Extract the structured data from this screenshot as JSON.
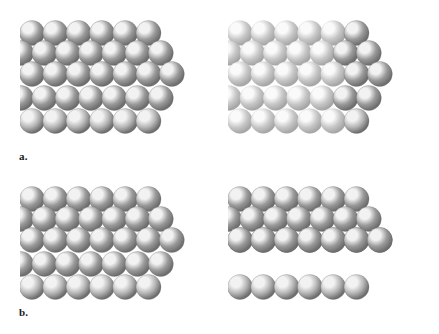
{
  "figure": {
    "background_color": "#ffffff",
    "width": 439,
    "height": 334,
    "labels": [
      {
        "id": "a",
        "text": "a.",
        "x": 19,
        "y": 151
      },
      {
        "id": "b",
        "text": "b.",
        "x": 19,
        "y": 307
      }
    ]
  },
  "sphere_style": {
    "base_color": "#9a9a9a",
    "highlight_color": "#f2f2f2",
    "midtone_color": "#b4b4b4",
    "shadow_color": "#6e6e6e",
    "edge_color": "#5a5a5a",
    "faded_base_color": "#c7c7c7",
    "faded_highlight_color": "#fafafa",
    "faded_shadow_color": "#a6a6a6",
    "radius": 12.5,
    "highlight_offset_x": -0.33,
    "highlight_offset_y": -0.38
  },
  "panels": [
    {
      "id": "a-left",
      "name": "hcp-aba-stacking-left-view",
      "row_label": "a",
      "column": "left",
      "x": 20,
      "y": 6,
      "width": 200,
      "height": 142,
      "faded_region": false,
      "columns": 6,
      "layers": [
        {
          "index": 0,
          "label": "top-row",
          "offset_x": 0,
          "y": 27,
          "count": 6,
          "shade": "mid"
        },
        {
          "index": 1,
          "label": "second-row",
          "offset_x": -11,
          "y": 47,
          "count": 7,
          "shade": "mid"
        },
        {
          "index": 2,
          "label": "third-row",
          "offset_x": 0,
          "y": 68,
          "count": 7,
          "shade": "mid"
        },
        {
          "index": 3,
          "label": "fourth-row",
          "offset_x": -11,
          "y": 92,
          "count": 7,
          "shade": "mid"
        },
        {
          "index": 4,
          "label": "bottom-row",
          "offset_x": 0,
          "y": 115,
          "count": 6,
          "shade": "light"
        }
      ]
    },
    {
      "id": "a-right",
      "name": "hcp-aba-stacking-right-view",
      "row_label": "a",
      "column": "right",
      "x": 228,
      "y": 6,
      "width": 200,
      "height": 142,
      "faded_region": true,
      "faded_region_x": 0,
      "faded_region_width": 112,
      "columns": 6,
      "layers": [
        {
          "index": 0,
          "label": "top-row",
          "offset_x": 0,
          "y": 27,
          "count": 6,
          "shade": "mid"
        },
        {
          "index": 1,
          "label": "second-row",
          "offset_x": -11,
          "y": 47,
          "count": 7,
          "shade": "mid"
        },
        {
          "index": 2,
          "label": "third-row",
          "offset_x": 0,
          "y": 68,
          "count": 7,
          "shade": "mid"
        },
        {
          "index": 3,
          "label": "fourth-row",
          "offset_x": -11,
          "y": 92,
          "count": 7,
          "shade": "mid"
        },
        {
          "index": 4,
          "label": "bottom-row",
          "offset_x": 0,
          "y": 115,
          "count": 6,
          "shade": "light"
        }
      ]
    },
    {
      "id": "b-left",
      "name": "ccp-abc-stacking-left-view",
      "row_label": "b",
      "column": "left",
      "x": 20,
      "y": 172,
      "width": 200,
      "height": 142,
      "faded_region": false,
      "columns": 6,
      "layers": [
        {
          "index": 0,
          "label": "top-row",
          "offset_x": 0,
          "y": 27,
          "count": 6,
          "shade": "mid"
        },
        {
          "index": 1,
          "label": "second-row",
          "offset_x": -11,
          "y": 47,
          "count": 7,
          "shade": "mid"
        },
        {
          "index": 2,
          "label": "third-row",
          "offset_x": 0,
          "y": 68,
          "count": 7,
          "shade": "mid"
        },
        {
          "index": 3,
          "label": "fourth-row",
          "offset_x": -11,
          "y": 92,
          "count": 7,
          "shade": "mid"
        },
        {
          "index": 4,
          "label": "bottom-row",
          "offset_x": 0,
          "y": 115,
          "count": 6,
          "shade": "light"
        }
      ]
    },
    {
      "id": "b-right",
      "name": "ccp-abc-stacking-right-view",
      "row_label": "b",
      "column": "right",
      "x": 228,
      "y": 172,
      "width": 200,
      "height": 142,
      "faded_region": false,
      "columns": 6,
      "layers": [
        {
          "index": 0,
          "label": "top-row",
          "offset_x": 0,
          "y": 27,
          "count": 6,
          "shade": "mid"
        },
        {
          "index": 1,
          "label": "second-row",
          "offset_x": -11,
          "y": 47,
          "count": 7,
          "shade": "mid"
        },
        {
          "index": 2,
          "label": "third-row",
          "offset_x": 0,
          "y": 68,
          "count": 7,
          "shade": "mid"
        },
        {
          "index": 3,
          "label": "fourth-row",
          "offset_x": 0,
          "y": 68,
          "count": 7,
          "shade": "mid"
        },
        {
          "index": 4,
          "label": "bottom-row",
          "offset_x": 0,
          "y": 115,
          "count": 6,
          "shade": "light"
        }
      ]
    }
  ]
}
